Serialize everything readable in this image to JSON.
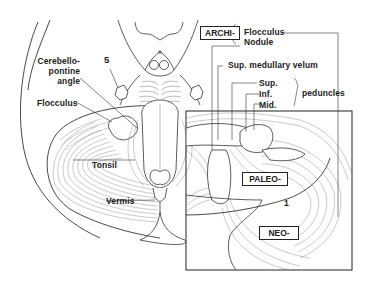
{
  "figure": {
    "type": "anatomical-diagram"
  },
  "labels": {
    "cerebellopontine_line1": "Cerebello-",
    "cerebellopontine_line2": "pontine",
    "cerebellopontine_line3": "angle",
    "nerve_5": "5",
    "flocculus_left": "Flocculus",
    "tonsil": "Tonsil",
    "vermis": "Vermis",
    "archi_box": "ARCHI-",
    "archi_flocculus": "Flocculus",
    "archi_nodule": "Nodule",
    "sup_medullary_velum": "Sup. medullary velum",
    "peduncle_sup": "Sup.",
    "peduncle_inf": "Inf.",
    "peduncle_mid": "Mid.",
    "peduncles": "peduncles",
    "paleo_box": "PALEO-",
    "neo_box": "NEO-",
    "fissure_1": "1"
  },
  "colors": {
    "line": "#333333",
    "fine_line": "#777777",
    "background": "#ffffff"
  }
}
